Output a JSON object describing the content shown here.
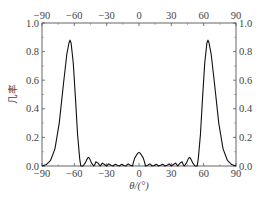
{
  "chart_data": {
    "type": "line",
    "title": "",
    "xlabel": "θ/(°)",
    "ylabel": "几率",
    "xlim": [
      -90,
      90
    ],
    "ylim": [
      0,
      1.0
    ],
    "grid": false,
    "legend": null,
    "x_ticks": [
      -90,
      -60,
      -30,
      0,
      30,
      60,
      90
    ],
    "x_tick_labels": [
      "-90",
      "-60",
      "-30",
      "0",
      "30",
      "60",
      "90"
    ],
    "x_top_tick_labels": [
      "-90",
      "-60",
      "-30",
      "0",
      "30",
      "60",
      "90"
    ],
    "y_ticks": [
      0.0,
      0.2,
      0.4,
      0.6,
      0.8,
      1.0
    ],
    "y_tick_labels": [
      "0.0",
      "0.2",
      "0.4",
      "0.6",
      "0.8",
      "1.0"
    ],
    "y_right_tick_labels": [
      "0.0",
      "0.2",
      "0.4",
      "0.6",
      "0.8",
      "1.0"
    ],
    "series": [
      {
        "name": "probability",
        "color": "#111111",
        "x": [
          -90,
          -86,
          -82,
          -78,
          -74,
          -70,
          -67,
          -65,
          -64,
          -63,
          -61,
          -59,
          -57,
          -55,
          -54,
          -52,
          -50,
          -48,
          -47,
          -46,
          -44,
          -42,
          -41,
          -40,
          -38,
          -36,
          -35,
          -34,
          -32,
          -30,
          -29,
          -28,
          -26,
          -24,
          -23,
          -22,
          -20,
          -18,
          -17,
          -16,
          -14,
          -12,
          -11,
          -10,
          -8,
          -6,
          -5,
          -4,
          -2,
          -1,
          0,
          1,
          2,
          4,
          5,
          6,
          8,
          10,
          11,
          12,
          14,
          16,
          17,
          18,
          20,
          22,
          23,
          24,
          26,
          28,
          29,
          30,
          32,
          34,
          35,
          36,
          38,
          40,
          41,
          42,
          44,
          46,
          47,
          48,
          50,
          52,
          54,
          55,
          57,
          59,
          61,
          63,
          64,
          65,
          67,
          70,
          74,
          78,
          82,
          86,
          90
        ],
        "y": [
          0.0,
          0.01,
          0.04,
          0.12,
          0.3,
          0.58,
          0.78,
          0.86,
          0.88,
          0.86,
          0.72,
          0.48,
          0.22,
          0.05,
          0.0,
          0.0,
          0.02,
          0.05,
          0.06,
          0.055,
          0.02,
          0.0,
          0.01,
          0.03,
          0.02,
          0.0,
          0.01,
          0.02,
          0.01,
          0.0,
          0.008,
          0.015,
          0.005,
          0.0,
          0.008,
          0.012,
          0.005,
          0.0,
          0.008,
          0.012,
          0.004,
          0.0,
          0.01,
          0.015,
          0.005,
          0.0,
          0.03,
          0.055,
          0.08,
          0.09,
          0.095,
          0.09,
          0.08,
          0.055,
          0.03,
          0.0,
          0.005,
          0.015,
          0.01,
          0.0,
          0.004,
          0.012,
          0.008,
          0.0,
          0.005,
          0.012,
          0.008,
          0.0,
          0.005,
          0.015,
          0.008,
          0.0,
          0.01,
          0.02,
          0.01,
          0.0,
          0.02,
          0.03,
          0.01,
          0.0,
          0.02,
          0.055,
          0.06,
          0.05,
          0.02,
          0.0,
          0.0,
          0.05,
          0.22,
          0.48,
          0.72,
          0.86,
          0.88,
          0.86,
          0.78,
          0.58,
          0.3,
          0.12,
          0.04,
          0.01,
          0.0
        ]
      }
    ],
    "peaks": [
      {
        "x": -64,
        "y": 0.88,
        "label": "main lobe left"
      },
      {
        "x": 0,
        "y": 0.095,
        "label": "central lobe"
      },
      {
        "x": 64,
        "y": 0.88,
        "label": "main lobe right"
      }
    ]
  },
  "layout": {
    "plot_left": 42,
    "plot_right": 236,
    "plot_top": 23,
    "plot_bottom": 166
  },
  "caption": "图 2-6  检测概率分布（示意，文字部分被裁切）"
}
